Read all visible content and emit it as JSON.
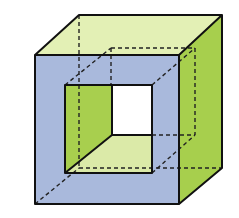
{
  "diagram": {
    "type": "geometric-solid",
    "colors": {
      "front_face": "#a9b9dc",
      "top_face": "#e3f0b5",
      "right_face": "#a7cf4d",
      "hole_left_wall": "#a8cf4e",
      "hole_floor": "#dbeaa8",
      "through_opening": "#ffffff",
      "edge": "#111111",
      "hidden_edge": "#222222"
    },
    "vertices": {
      "front_face": [
        [
          35,
          55
        ],
        [
          179,
          55
        ],
        [
          179,
          204
        ],
        [
          35,
          204
        ]
      ],
      "back_face": [
        [
          79,
          15
        ],
        [
          222,
          15
        ],
        [
          222,
          168
        ],
        [
          79,
          168
        ]
      ],
      "front_hole": [
        [
          65,
          85
        ],
        [
          152,
          85
        ],
        [
          152,
          173
        ],
        [
          65,
          173
        ]
      ],
      "back_hole": [
        [
          111,
          48
        ],
        [
          195,
          48
        ],
        [
          195,
          135
        ],
        [
          111,
          135
        ]
      ],
      "visible_opening": [
        [
          112,
          85
        ],
        [
          152,
          85
        ],
        [
          152,
          135
        ],
        [
          112,
          135
        ]
      ]
    }
  }
}
